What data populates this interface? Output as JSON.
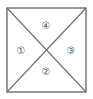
{
  "figure": {
    "type": "geometry-diagram",
    "background_color": "#ffffff"
  },
  "square": {
    "name": "outer-square",
    "left": 7,
    "top": 8,
    "right": 86,
    "bottom": 92,
    "stroke_color": "#6e6e6e",
    "stroke_width": 1.4,
    "fill_color": "#ffffff"
  },
  "diagonals": [
    {
      "name": "diagonal-tl-br",
      "from": [
        7,
        8
      ],
      "to": [
        86,
        92
      ],
      "stroke_color": "#6e6e6e",
      "stroke_width": 1.1
    },
    {
      "name": "diagonal-tr-bl",
      "from": [
        86,
        8
      ],
      "to": [
        7,
        92
      ],
      "stroke_color": "#6e6e6e",
      "stroke_width": 1.1
    }
  ],
  "center_point": {
    "name": "diagonal-intersection",
    "x": 46,
    "y": 50
  },
  "regions": [
    {
      "key": "top",
      "label": "④",
      "number": 4,
      "position": "top-triangle",
      "label_x": 46,
      "label_y": 26,
      "text_color": "#5a5a5a"
    },
    {
      "key": "left",
      "label": "①",
      "number": 1,
      "position": "left-triangle",
      "label_x": 21,
      "label_y": 51,
      "text_color": "#5a5a5a"
    },
    {
      "key": "right",
      "label": "③",
      "number": 3,
      "position": "right-triangle",
      "label_x": 71,
      "label_y": 51,
      "text_color": "#5a5a5a"
    },
    {
      "key": "bottom",
      "label": "②",
      "number": 2,
      "position": "bottom-triangle",
      "label_x": 46,
      "label_y": 72,
      "text_color": "#5a5a5a"
    }
  ]
}
